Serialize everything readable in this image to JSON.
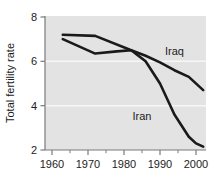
{
  "chart_data": {
    "type": "line",
    "title": "",
    "subtitle": "",
    "xlabel": "",
    "ylabel": "Total fertility rate",
    "xlim": [
      1960,
      2003
    ],
    "ylim": [
      2,
      8
    ],
    "xticks": [
      1960,
      1970,
      1980,
      1990,
      2000
    ],
    "xtick_labels": [
      "1960",
      "1970",
      "1980",
      "1990",
      "2000"
    ],
    "x_minor_ticks": [
      1965,
      1975,
      1985,
      1995
    ],
    "yticks": [
      2,
      4,
      6,
      8
    ],
    "ytick_labels": [
      "2",
      "4",
      "6",
      "8"
    ],
    "grid": "horizontal-white-gridlines",
    "legend": "inline-series-labels",
    "plot_background": "#e3e3e3",
    "line_color": "#1a1a1a",
    "series": [
      {
        "name": "Iraq",
        "label": "Iraq",
        "label_x": 1994,
        "label_y": 6.3,
        "x": [
          1963,
          1972,
          1982,
          1986,
          1990,
          1994,
          1998,
          2002
        ],
        "values": [
          7.2,
          7.15,
          6.5,
          6.25,
          5.95,
          5.6,
          5.3,
          4.7
        ]
      },
      {
        "name": "Iran",
        "label": "Iran",
        "label_x": 1985,
        "label_y": 3.35,
        "x": [
          1963,
          1972,
          1978,
          1982,
          1986,
          1990,
          1994,
          1998,
          2000,
          2002
        ],
        "values": [
          7.0,
          6.35,
          6.45,
          6.5,
          6.0,
          5.0,
          3.6,
          2.6,
          2.3,
          2.15
        ]
      }
    ]
  },
  "axis": {
    "y_title": "Total fertility rate",
    "y_tick_0": "2",
    "y_tick_1": "4",
    "y_tick_2": "6",
    "y_tick_3": "8",
    "x_tick_0": "1960",
    "x_tick_1": "1970",
    "x_tick_2": "1980",
    "x_tick_3": "1990",
    "x_tick_4": "2000"
  },
  "labels": {
    "iraq": "Iraq",
    "iran": "Iran"
  },
  "colors": {
    "plot_background": "#e3e3e3",
    "line": "#1a1a1a",
    "gridline": "#f7f7f7",
    "axis": "#6e6e6e",
    "text": "#1c1c1c"
  }
}
